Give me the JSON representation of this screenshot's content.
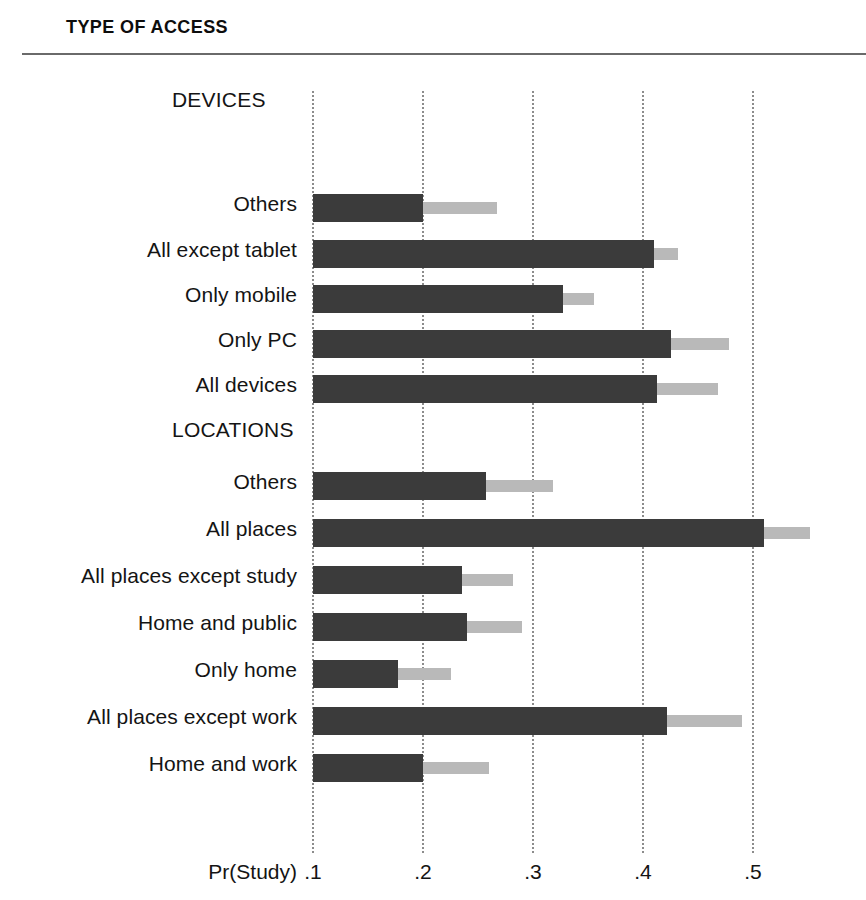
{
  "figure": {
    "title": "TYPE OF ACCESS",
    "axis_title": "Pr(Study)"
  },
  "colors": {
    "bar_estimate": "#3b3b3b",
    "bar_interval": "#b9b9b9",
    "gridline": "#8c8c8c",
    "rule": "#6a6a6a",
    "text": "#141414"
  },
  "chart_data": {
    "type": "bar",
    "title": "TYPE OF ACCESS",
    "xlabel": "Pr(Study)",
    "ylabel": "",
    "orientation": "horizontal",
    "xlim": [
      0.1,
      0.575
    ],
    "bar_origin": 0.1,
    "grid": true,
    "gridlines": "vertical dotted at each x tick",
    "legend": null,
    "xticks": [
      0.1,
      0.2,
      0.3,
      0.4,
      0.5
    ],
    "xticklabels": [
      ".1",
      ".2",
      ".3",
      ".4",
      ".5"
    ],
    "series": [
      {
        "name": "estimate",
        "color": "#3b3b3b"
      },
      {
        "name": "upper interval",
        "color": "#b9b9b9"
      }
    ],
    "groups": [
      {
        "name": "DEVICES",
        "categories": [
          "Others",
          "All except tablet",
          "Only mobile",
          "Only PC",
          "All devices"
        ],
        "values": [
          0.2,
          0.41,
          0.327,
          0.425,
          0.413
        ],
        "upper": [
          0.267,
          0.432,
          0.355,
          0.478,
          0.468
        ]
      },
      {
        "name": "LOCATIONS",
        "categories": [
          "Others",
          "All places",
          "All places except study",
          "Home and public",
          "Only home",
          "All places except work",
          "Home and work"
        ],
        "values": [
          0.257,
          0.51,
          0.235,
          0.24,
          0.177,
          0.422,
          0.2
        ],
        "upper": [
          0.318,
          0.552,
          0.282,
          0.29,
          0.225,
          0.49,
          0.26
        ]
      }
    ]
  }
}
